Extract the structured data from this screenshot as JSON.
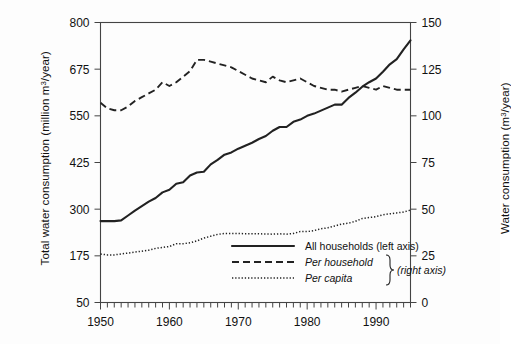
{
  "chart_data": {
    "type": "line",
    "title": "",
    "subtitle": "",
    "xlabel": "",
    "ylabel": "Total water consumption (million m3/year)",
    "ylabel_right": "Water consumption (m3/year)",
    "xlim": [
      1950,
      1995
    ],
    "ylim": [
      50,
      800
    ],
    "ylim_right": [
      0,
      150
    ],
    "grid": false,
    "legend_position": "inside-bottom-right",
    "xticks": [
      1950,
      1960,
      1970,
      1980,
      1990
    ],
    "xtick_labels": [
      "1950",
      "1960",
      "1970",
      "1980",
      "1990"
    ],
    "xminor_tick_interval": 1,
    "yticks_left": [
      50,
      175,
      300,
      425,
      550,
      675,
      800
    ],
    "ytick_labels_left": [
      "50",
      "175",
      "300",
      "425",
      "550",
      "675",
      "800"
    ],
    "yticks_right": [
      0,
      25,
      50,
      75,
      100,
      125,
      150
    ],
    "ytick_labels_right": [
      "0",
      "25",
      "50",
      "75",
      "100",
      "125",
      "150"
    ],
    "x": [
      1950,
      1951,
      1952,
      1953,
      1954,
      1955,
      1956,
      1957,
      1958,
      1959,
      1960,
      1961,
      1962,
      1963,
      1964,
      1965,
      1966,
      1967,
      1968,
      1969,
      1970,
      1971,
      1972,
      1973,
      1974,
      1975,
      1976,
      1977,
      1978,
      1979,
      1980,
      1981,
      1982,
      1983,
      1984,
      1985,
      1986,
      1987,
      1988,
      1989,
      1990,
      1991,
      1992,
      1993,
      1994,
      1995
    ],
    "series": [
      {
        "name": "All households (left axis)",
        "axis": "left",
        "style": "solid",
        "units": "million m3/year",
        "values": [
          268,
          268,
          268,
          270,
          283,
          296,
          308,
          320,
          330,
          345,
          352,
          368,
          372,
          390,
          398,
          400,
          420,
          432,
          446,
          452,
          462,
          470,
          478,
          488,
          496,
          510,
          520,
          520,
          534,
          540,
          550,
          556,
          564,
          572,
          580,
          580,
          598,
          612,
          628,
          640,
          650,
          668,
          688,
          702,
          728,
          752
        ]
      },
      {
        "name": "Per household",
        "axis": "right",
        "style": "dashed",
        "units": "m3/year",
        "values": [
          107,
          104,
          103,
          103,
          105,
          108,
          110,
          112,
          114,
          118,
          116,
          118,
          121,
          124,
          130,
          130,
          129,
          128,
          127,
          126,
          124,
          122,
          120,
          119,
          118,
          121,
          119,
          118,
          119,
          120,
          118,
          116,
          115,
          114,
          114,
          113,
          114,
          115,
          116,
          115,
          114,
          116,
          115,
          114,
          114,
          114
        ]
      },
      {
        "name": "Per capita",
        "axis": "right",
        "style": "dotted",
        "units": "m3/year",
        "values": [
          26,
          25.5,
          25.5,
          26,
          26.5,
          27,
          27.5,
          28,
          29,
          29.5,
          30,
          31.5,
          31.5,
          32,
          33,
          34.5,
          35.5,
          36.5,
          37,
          37,
          37,
          36.8,
          36.8,
          36.8,
          36.7,
          36.6,
          36.8,
          36.6,
          37,
          38,
          38,
          38.5,
          39.5,
          40,
          41,
          42,
          42.5,
          43.5,
          45,
          45.5,
          46,
          47,
          47.5,
          48,
          48.5,
          49.5
        ]
      }
    ],
    "legend": [
      {
        "label": "All households (left axis)",
        "style": "solid",
        "italic": false
      },
      {
        "label": "Per household",
        "style": "dashed",
        "italic": true
      },
      {
        "label": "Per capita",
        "style": "dotted",
        "italic": true
      }
    ],
    "legend_brace_note": "(right axis)"
  },
  "colors": {
    "line": "#222222",
    "frame": "#444444",
    "background": "#fdfdfd",
    "text": "#111111"
  }
}
